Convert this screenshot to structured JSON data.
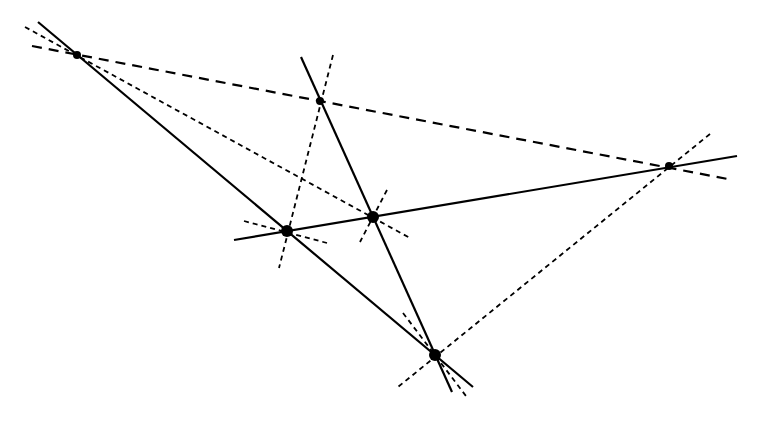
{
  "diagram": {
    "width": 763,
    "height": 422,
    "background": "#ffffff",
    "stroke_color": "#000000",
    "points": [
      {
        "id": "P1",
        "x": 77,
        "y": 55,
        "r": 4
      },
      {
        "id": "P2",
        "x": 320,
        "y": 101,
        "r": 4
      },
      {
        "id": "P3",
        "x": 669,
        "y": 166,
        "r": 4
      },
      {
        "id": "P4",
        "x": 287,
        "y": 231,
        "r": 6
      },
      {
        "id": "P5",
        "x": 373,
        "y": 217,
        "r": 6
      },
      {
        "id": "P6",
        "x": 435,
        "y": 355,
        "r": 6
      }
    ],
    "solid_lines": [
      {
        "id": "s1",
        "x1": 38,
        "y1": 22,
        "x2": 473,
        "y2": 387
      },
      {
        "id": "s2",
        "x1": 301,
        "y1": 57,
        "x2": 452,
        "y2": 392
      },
      {
        "id": "s3",
        "x1": 234,
        "y1": 240,
        "x2": 737,
        "y2": 156
      }
    ],
    "long_dashed_lines": [
      {
        "id": "d1",
        "x1": 32,
        "y1": 46,
        "x2": 733,
        "y2": 180
      }
    ],
    "short_dashed_lines": [
      {
        "id": "q1",
        "x1": 25,
        "y1": 27,
        "x2": 410,
        "y2": 238
      },
      {
        "id": "q2",
        "x1": 333,
        "y1": 55,
        "x2": 279,
        "y2": 268
      },
      {
        "id": "q3",
        "x1": 710,
        "y1": 134,
        "x2": 398,
        "y2": 387
      },
      {
        "id": "q4",
        "x1": 244,
        "y1": 221,
        "x2": 327,
        "y2": 243
      },
      {
        "id": "q5",
        "x1": 387,
        "y1": 190,
        "x2": 360,
        "y2": 242
      },
      {
        "id": "q6",
        "x1": 403,
        "y1": 313,
        "x2": 466,
        "y2": 396
      }
    ]
  }
}
